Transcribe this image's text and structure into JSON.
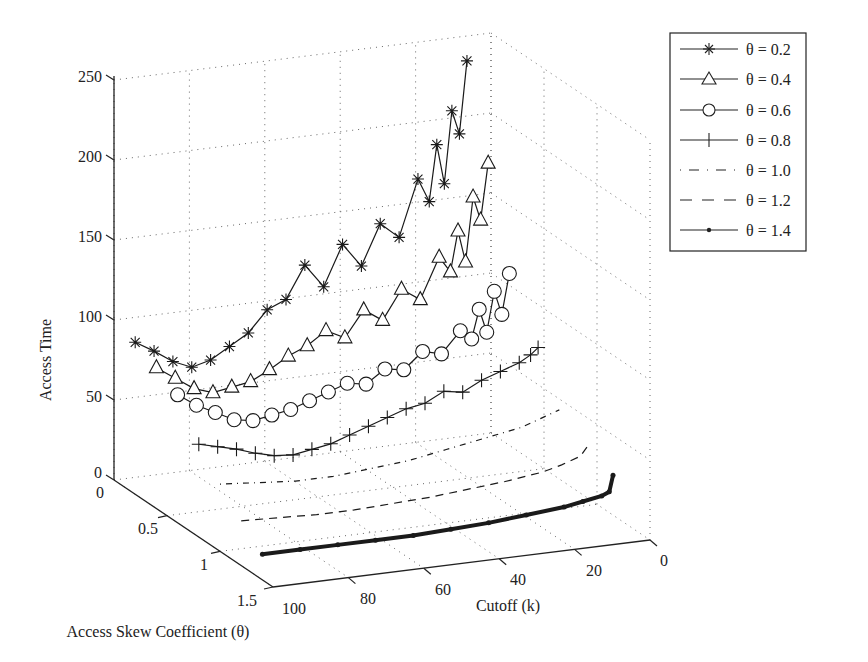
{
  "chart_data": {
    "type": "line",
    "projection": "3d",
    "title": "",
    "xlabel": "Cutoff (k)",
    "ylabel": "Access Skew Coefficient (θ)",
    "zlabel": "Access Time",
    "x_ticks": [
      "100",
      "80",
      "60",
      "40",
      "20",
      "0"
    ],
    "x_range": [
      0,
      100
    ],
    "y_ticks": [
      "0",
      "0.5",
      "1",
      "1.5"
    ],
    "y_range": [
      0,
      1.5
    ],
    "z_ticks": [
      "0",
      "50",
      "100",
      "150",
      "200",
      "250"
    ],
    "z_range": [
      0,
      250
    ],
    "grid": true,
    "legend_position": "upper right",
    "series": [
      {
        "name": "θ = 0.2",
        "theta": 0.2,
        "marker": "asterisk",
        "style": "solid",
        "x": [
          100,
          95,
          90,
          85,
          80,
          75,
          70,
          65,
          60,
          55,
          50,
          45,
          40,
          35,
          30,
          25,
          22,
          20,
          18,
          16,
          14,
          12
        ],
        "z": [
          95,
          88,
          80,
          75,
          78,
          85,
          92,
          105,
          110,
          130,
          115,
          140,
          125,
          150,
          140,
          175,
          160,
          195,
          170,
          215,
          200,
          245
        ]
      },
      {
        "name": "θ = 0.4",
        "theta": 0.4,
        "marker": "triangle",
        "style": "solid",
        "x": [
          100,
          95,
          90,
          85,
          80,
          75,
          70,
          65,
          60,
          55,
          50,
          45,
          40,
          35,
          30,
          25,
          22,
          20,
          18,
          16,
          14,
          12
        ],
        "z": [
          88,
          80,
          72,
          68,
          70,
          72,
          78,
          85,
          90,
          98,
          92,
          108,
          100,
          118,
          110,
          135,
          125,
          150,
          130,
          170,
          155,
          190
        ]
      },
      {
        "name": "θ = 0.6",
        "theta": 0.6,
        "marker": "circle",
        "style": "solid",
        "x": [
          100,
          95,
          90,
          85,
          80,
          75,
          70,
          65,
          60,
          55,
          50,
          45,
          40,
          35,
          30,
          25,
          22,
          20,
          18,
          16,
          14,
          12
        ],
        "z": [
          80,
          72,
          66,
          60,
          58,
          60,
          62,
          66,
          70,
          74,
          72,
          80,
          78,
          88,
          85,
          98,
          92,
          110,
          95,
          120,
          105,
          130
        ]
      },
      {
        "name": "θ = 0.8",
        "theta": 0.8,
        "marker": "plus",
        "style": "solid",
        "x": [
          100,
          95,
          90,
          85,
          80,
          75,
          70,
          65,
          60,
          55,
          50,
          45,
          40,
          35,
          30,
          25,
          20,
          15,
          12,
          10
        ],
        "z": [
          58,
          55,
          52,
          48,
          45,
          44,
          46,
          48,
          52,
          56,
          60,
          64,
          66,
          72,
          70,
          76,
          80,
          84,
          88,
          92
        ]
      },
      {
        "name": "θ = 1.0",
        "theta": 1.0,
        "marker": "none",
        "style": "dashdot",
        "x": [
          100,
          90,
          80,
          70,
          60,
          50,
          40,
          30,
          20,
          15,
          10
        ],
        "z": [
          42,
          40,
          38,
          38,
          40,
          42,
          46,
          50,
          54,
          58,
          62
        ]
      },
      {
        "name": "θ = 1.2",
        "theta": 1.2,
        "marker": "none",
        "style": "dashed",
        "x": [
          100,
          90,
          80,
          70,
          60,
          50,
          40,
          30,
          20,
          15,
          10,
          8
        ],
        "z": [
          28,
          27,
          26,
          26,
          27,
          28,
          30,
          32,
          35,
          38,
          42,
          48
        ]
      },
      {
        "name": "θ = 1.4",
        "theta": 1.4,
        "marker": "dot",
        "style": "solid",
        "x": [
          100,
          90,
          80,
          70,
          60,
          50,
          40,
          30,
          20,
          15,
          10,
          8,
          7
        ],
        "z": [
          16,
          16,
          16,
          16,
          16,
          17,
          18,
          20,
          22,
          24,
          26,
          28,
          38
        ]
      }
    ]
  },
  "legend": {
    "items": [
      {
        "label": "θ = 0.2",
        "marker": "asterisk"
      },
      {
        "label": "θ = 0.4",
        "marker": "triangle"
      },
      {
        "label": "θ = 0.6",
        "marker": "circle"
      },
      {
        "label": "θ = 0.8",
        "marker": "plus"
      },
      {
        "label": "θ = 1.0",
        "marker": "dashdot"
      },
      {
        "label": "θ = 1.2",
        "marker": "dashed"
      },
      {
        "label": "θ = 1.4",
        "marker": "dot"
      }
    ]
  },
  "axes": {
    "z_title": "Access Time",
    "x_title": "Cutoff (k)",
    "y_title": "Access Skew Coefficient (θ)",
    "z_ticks": [
      "250",
      "200",
      "150",
      "100",
      "50",
      "0"
    ],
    "theta_ticks": [
      "0",
      "0.5",
      "1",
      "1.5"
    ],
    "k_ticks": [
      "100",
      "80",
      "60",
      "40",
      "20",
      "0"
    ]
  },
  "colors": {
    "line": "#1a1a1a",
    "grid": "#555555",
    "background": "#ffffff"
  }
}
